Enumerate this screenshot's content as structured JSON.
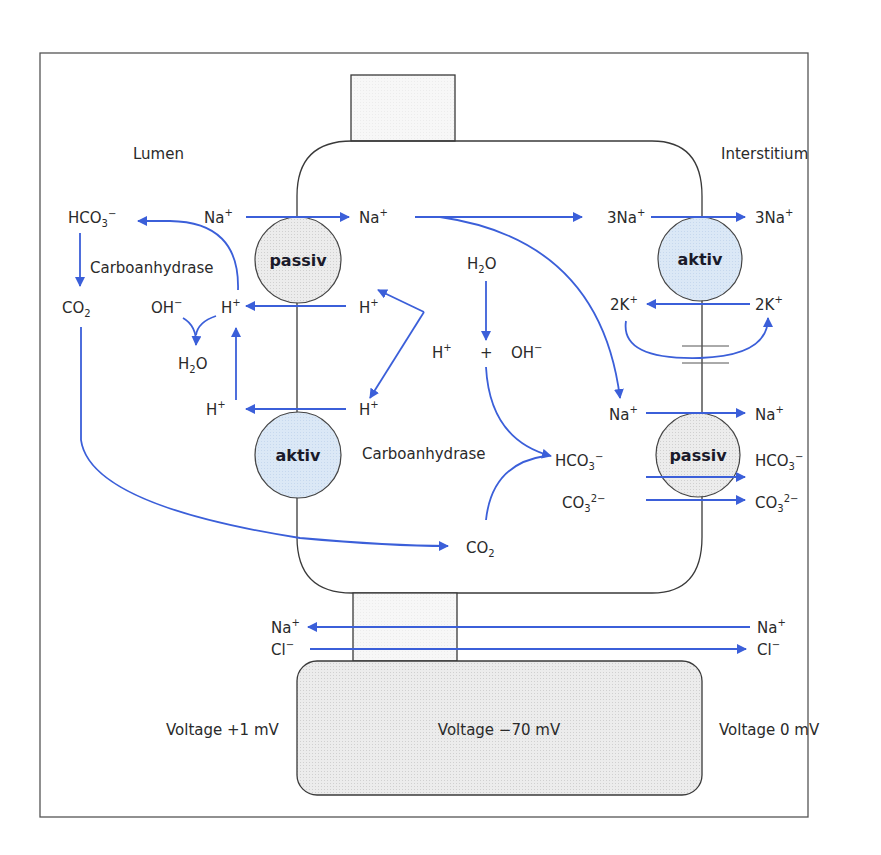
{
  "regions": {
    "lumen": "Lumen",
    "interstitium": "Interstitium"
  },
  "transporters": {
    "apical_top": "passiv",
    "apical_bottom": "aktiv",
    "basolateral_top": "aktiv",
    "basolateral_bottom": "passiv"
  },
  "enzymes": {
    "lumen": "Carboanhydrase",
    "cell": "Carboanhydrase"
  },
  "species": {
    "lumen_hco3": "HCO3−",
    "lumen_na": "Na+",
    "lumen_co2": "CO2",
    "lumen_oh": "OH−",
    "lumen_h_top": "H+",
    "lumen_h2o": "H2O",
    "lumen_h_bottom": "H+",
    "cell_na": "Na+",
    "cell_h_top": "H+",
    "cell_h_mid": "H+",
    "cell_h_bottom": "H+",
    "cell_h2o": "H2O",
    "cell_plus": "+",
    "cell_oh": "OH−",
    "cell_hco3": "HCO3−",
    "cell_co3": "CO32−",
    "cell_co2": "CO2",
    "cell_3na": "3Na+",
    "cell_2k": "2K+",
    "cell_na_baso": "Na+",
    "int_3na": "3Na+",
    "int_2k": "2K+",
    "int_na": "Na+",
    "int_hco3": "HCO3−",
    "int_co3": "CO32−",
    "para_na_lumen": "Na+",
    "para_cl_lumen": "Cl−",
    "para_na_int": "Na+",
    "para_cl_int": "Cl−"
  },
  "voltages": {
    "lumen": "Voltage +1 mV",
    "cell": "Voltage −70 mV",
    "interstitium": "Voltage 0 mV"
  },
  "colors": {
    "arrow": "#3b5fd9",
    "aktiv_fill": "#d7e6f5",
    "passiv_fill": "#e6e6e6",
    "cell_border": "#3a3a3a"
  }
}
